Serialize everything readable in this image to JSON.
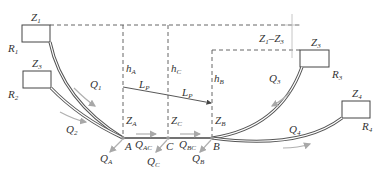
{
  "diagram": {
    "type": "branching pipe network with reservoirs",
    "reservoirs": [
      {
        "id": "R1",
        "label": "R",
        "label_sub": "1",
        "level": "Z",
        "level_sub": "1"
      },
      {
        "id": "R2",
        "label": "R",
        "label_sub": "2",
        "level": "Z",
        "level_sub": "3"
      },
      {
        "id": "R3",
        "label": "R",
        "label_sub": "3",
        "level": "Z",
        "level_sub": "3"
      },
      {
        "id": "R4",
        "label": "R",
        "label_sub": "4",
        "level": "Z",
        "level_sub": "4"
      }
    ],
    "head_difference": {
      "text_a": "Z",
      "sub_a": "1",
      "dash": "–",
      "text_b": "Z",
      "sub_b": "3"
    },
    "nodes": [
      {
        "id": "A",
        "label": "A",
        "elev": "Z",
        "elev_sub": "A",
        "head": "h",
        "head_sub": "A",
        "outflow": "Q",
        "outflow_sub": "A"
      },
      {
        "id": "C",
        "label": "C",
        "elev": "Z",
        "elev_sub": "C",
        "head": "h",
        "head_sub": "C",
        "outflow": "Q",
        "outflow_sub": "C"
      },
      {
        "id": "B",
        "label": "B",
        "elev": "Z",
        "elev_sub": "B",
        "head": "h",
        "head_sub": "B",
        "outflow": "Q",
        "outflow_sub": "B"
      }
    ],
    "flows": [
      {
        "id": "Q1",
        "text": "Q",
        "sub": "1"
      },
      {
        "id": "Q2",
        "text": "Q",
        "sub": "2"
      },
      {
        "id": "Q3",
        "text": "Q",
        "sub": "3"
      },
      {
        "id": "Q4",
        "text": "Q",
        "sub": "4"
      },
      {
        "id": "QAC",
        "text": "Q",
        "sub": "AC"
      },
      {
        "id": "QBC",
        "text": "Q",
        "sub": "BC"
      }
    ],
    "segments": [
      {
        "id": "LP1",
        "text": "L",
        "sub": "P"
      },
      {
        "id": "LP2",
        "text": "L",
        "sub": "P"
      }
    ]
  }
}
